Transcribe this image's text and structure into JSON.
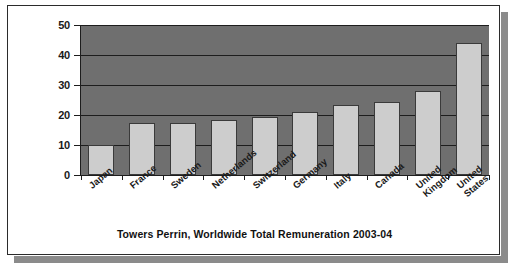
{
  "caption": "Towers Perrin, Worldwide Total Remuneration 2003-04",
  "colors": {
    "plot_background": "#6f6f6f",
    "bar_fill": "#cdcdcd",
    "bar_border": "#3a3a3a",
    "gridline": "#1d1d1d",
    "frame_border": "#2b2b2b",
    "shadow": "#8b8b8b",
    "text": "#1a1a1a"
  },
  "chart_data": {
    "type": "bar",
    "title": "Towers Perrin, Worldwide Total Remuneration 2003-04",
    "xlabel": "",
    "ylabel": "",
    "ylim": [
      0,
      50
    ],
    "yticks": [
      0,
      10,
      20,
      30,
      40,
      50
    ],
    "ytick_labels": [
      "0",
      "10",
      "20",
      "30",
      "40",
      "50"
    ],
    "grid": true,
    "legend": false,
    "categories": [
      "Japan",
      "France",
      "Sweden",
      "Netherlands",
      "Switzerland",
      "Germany",
      "Italy",
      "Canada",
      "United Kingdom",
      "United States"
    ],
    "category_lines": [
      [
        "Japan"
      ],
      [
        "France"
      ],
      [
        "Sweden"
      ],
      [
        "Netherlands"
      ],
      [
        "Switzerland"
      ],
      [
        "Germany"
      ],
      [
        "Italy"
      ],
      [
        "Canada"
      ],
      [
        "United",
        "Kingdom"
      ],
      [
        "United",
        "States"
      ]
    ],
    "values": [
      10,
      17.3,
      17.3,
      18.3,
      19.4,
      21,
      23.5,
      24.3,
      28,
      44
    ]
  }
}
